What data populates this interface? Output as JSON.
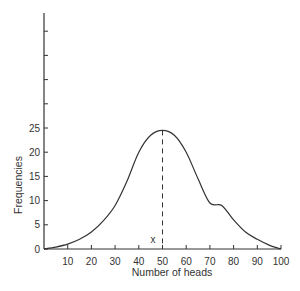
{
  "chart_data": {
    "type": "line",
    "title": "",
    "xlabel": "Number of heads",
    "ylabel": "Frequencies",
    "xlim": [
      0,
      100
    ],
    "ylim": [
      0,
      45
    ],
    "x_ticks": [
      10,
      20,
      30,
      40,
      50,
      60,
      70,
      80,
      90,
      100
    ],
    "y_ticks": [
      0,
      5,
      10,
      15,
      20,
      25
    ],
    "y_unlabeled_ticks": [
      30,
      35,
      40,
      45
    ],
    "grid": false,
    "legend": null,
    "series": [
      {
        "name": "frequency curve",
        "x": [
          0,
          5,
          10,
          15,
          20,
          25,
          30,
          35,
          40,
          45,
          50,
          55,
          60,
          65,
          70,
          75,
          80,
          85,
          90,
          95,
          100
        ],
        "y": [
          0,
          0.4,
          1,
          2,
          3.5,
          5.8,
          9,
          14,
          20,
          23.5,
          24.5,
          23.5,
          20,
          14.5,
          9.5,
          9,
          6,
          3.5,
          2,
          0.8,
          0
        ]
      }
    ],
    "annotations": [
      {
        "type": "dashed-vline",
        "x": 50,
        "y_from": 0,
        "y_to": 24.5
      },
      {
        "type": "text",
        "text": "x",
        "x": 46,
        "y": 1.5
      }
    ]
  }
}
